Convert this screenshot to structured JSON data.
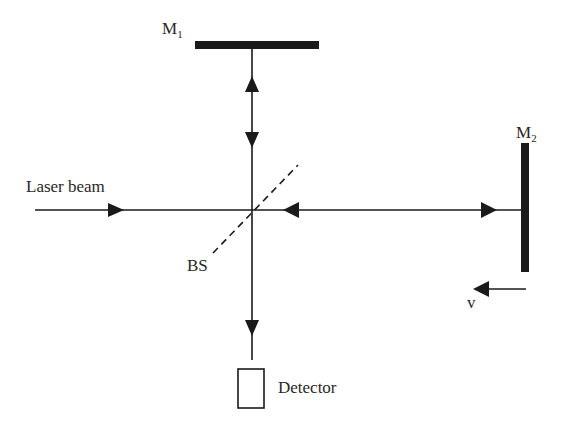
{
  "diagram": {
    "colors": {
      "ink": "#1a1a1a",
      "text": "#2b2728",
      "background": "#ffffff"
    },
    "labels": {
      "mirror1": {
        "main": "M",
        "sub": "1"
      },
      "mirror2": {
        "main": "M",
        "sub": "2"
      },
      "laser": "Laser beam",
      "beam_splitter": "BS",
      "detector": "Detector",
      "velocity": "v"
    },
    "components": [
      {
        "id": "mirror-1",
        "type": "mirror",
        "orientation": "horizontal"
      },
      {
        "id": "mirror-2",
        "type": "mirror",
        "orientation": "vertical",
        "moving": true
      },
      {
        "id": "beam-splitter",
        "type": "beam-splitter",
        "style": "dashed"
      },
      {
        "id": "detector",
        "type": "detector"
      },
      {
        "id": "laser-source",
        "type": "input-beam"
      }
    ],
    "arrows": [
      {
        "path": "laser-to-bs",
        "direction": "right"
      },
      {
        "path": "bs-m1",
        "direction": "up"
      },
      {
        "path": "bs-m1",
        "direction": "down"
      },
      {
        "path": "bs-m2",
        "direction": "left"
      },
      {
        "path": "bs-m2",
        "direction": "right"
      },
      {
        "path": "bs-detector",
        "direction": "down"
      },
      {
        "path": "m2-velocity",
        "direction": "left"
      }
    ]
  }
}
